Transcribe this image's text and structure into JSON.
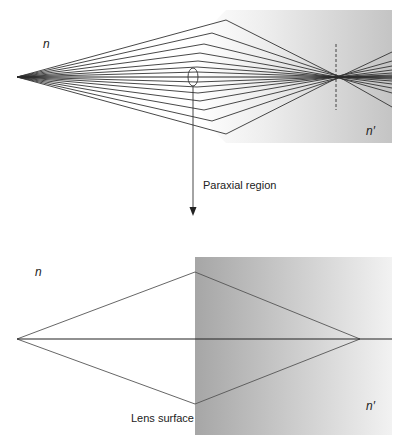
{
  "top_diagram": {
    "medium_left_label": "n",
    "medium_right_label": "n′",
    "annotation": "Paraxial region",
    "description": "Spherical aberration: rays from an axial point refracted by a curved surface fail to meet at one focus"
  },
  "bottom_diagram": {
    "medium_left_label": "n",
    "medium_right_label": "n′",
    "surface_label": "Lens surface",
    "description": "Paraxial approximation: rays converge to a single focal point"
  },
  "colors": {
    "ray": "#333333",
    "background": "#ffffff",
    "medium_dark": "#a8a8a8",
    "medium_light": "#f0f0f0"
  }
}
